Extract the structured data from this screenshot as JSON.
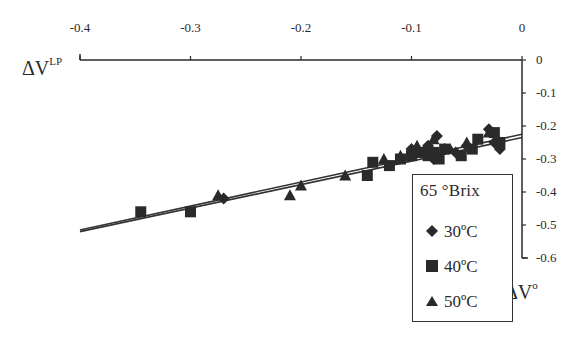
{
  "chart_data": {
    "type": "scatter",
    "title": "",
    "xlabel": "ΔV°",
    "ylabel": "ΔV^LP",
    "xlim": [
      -0.4,
      0
    ],
    "ylim": [
      -0.6,
      0
    ],
    "x_ticks": [
      "-0.4",
      "-0.3",
      "-0.2",
      "-0.1",
      "0"
    ],
    "y_ticks": [
      "0",
      "-0.1",
      "-0.2",
      "-0.3",
      "-0.4",
      "-0.5",
      "-0.6"
    ],
    "x_axis_position": "top",
    "y_axis_position": "right",
    "grid": false,
    "legend": {
      "title": "65 °Brix",
      "position": "lower-right",
      "entries": [
        "30ºC",
        "40ºC",
        "50ºC"
      ]
    },
    "series": [
      {
        "name": "30ºC",
        "marker": "diamond",
        "points": [
          [
            -0.27,
            -0.42
          ],
          [
            -0.1,
            -0.27
          ],
          [
            -0.095,
            -0.28
          ],
          [
            -0.085,
            -0.26
          ],
          [
            -0.08,
            -0.3
          ],
          [
            -0.077,
            -0.23
          ],
          [
            -0.07,
            -0.27
          ],
          [
            -0.06,
            -0.28
          ],
          [
            -0.05,
            -0.26
          ],
          [
            -0.03,
            -0.21
          ],
          [
            -0.025,
            -0.25
          ],
          [
            -0.02,
            -0.27
          ]
        ]
      },
      {
        "name": "40ºC",
        "marker": "square",
        "points": [
          [
            -0.345,
            -0.46
          ],
          [
            -0.3,
            -0.46
          ],
          [
            -0.14,
            -0.35
          ],
          [
            -0.135,
            -0.31
          ],
          [
            -0.12,
            -0.32
          ],
          [
            -0.11,
            -0.3
          ],
          [
            -0.1,
            -0.29
          ],
          [
            -0.09,
            -0.28
          ],
          [
            -0.085,
            -0.29
          ],
          [
            -0.08,
            -0.28
          ],
          [
            -0.075,
            -0.3
          ],
          [
            -0.07,
            -0.27
          ],
          [
            -0.055,
            -0.29
          ],
          [
            -0.045,
            -0.27
          ],
          [
            -0.04,
            -0.24
          ],
          [
            -0.025,
            -0.22
          ],
          [
            -0.02,
            -0.25
          ]
        ]
      },
      {
        "name": "50ºC",
        "marker": "triangle",
        "points": [
          [
            -0.275,
            -0.41
          ],
          [
            -0.21,
            -0.41
          ],
          [
            -0.2,
            -0.38
          ],
          [
            -0.16,
            -0.35
          ],
          [
            -0.125,
            -0.3
          ],
          [
            -0.11,
            -0.29
          ],
          [
            -0.095,
            -0.26
          ],
          [
            -0.09,
            -0.28
          ],
          [
            -0.08,
            -0.24
          ],
          [
            -0.065,
            -0.27
          ],
          [
            -0.05,
            -0.25
          ],
          [
            -0.03,
            -0.22
          ]
        ]
      }
    ],
    "fit_lines": [
      {
        "name": "fit-1",
        "from": [
          -0.4,
          -0.515
        ],
        "to": [
          0,
          -0.225
        ]
      },
      {
        "name": "fit-2",
        "from": [
          -0.4,
          -0.52
        ],
        "to": [
          0,
          -0.235
        ]
      }
    ]
  },
  "labels": {
    "y_axis_title": "ΔV",
    "y_axis_sup": "LP",
    "x_axis_title": "ΔV",
    "x_axis_sup": "o",
    "legend_title": "65 °Brix",
    "legend_30": "30ºC",
    "legend_40": "40ºC",
    "legend_50": "50ºC"
  }
}
